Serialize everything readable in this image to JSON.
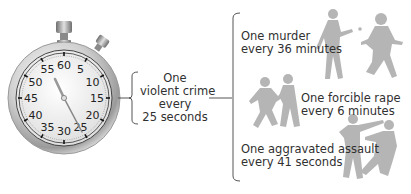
{
  "stopwatch": {
    "dial_numbers": [
      "60",
      "5",
      "10",
      "15",
      "20",
      "25",
      "30",
      "35",
      "40",
      "45",
      "50",
      "55"
    ],
    "hand_position_seconds": 25
  },
  "summary": {
    "line1": "One",
    "line2": "violent crime",
    "line3": "every",
    "line4": "25 seconds"
  },
  "crimes": [
    {
      "line1": "One murder",
      "line2": "every 36 minutes",
      "figure": "shooting-silhouette"
    },
    {
      "line1": "One forcible rape",
      "line2": "every 6 minutes",
      "figure": "struggle-silhouette"
    },
    {
      "line1": "One aggravated assault",
      "line2": "every 41 seconds",
      "figure": "fight-silhouette"
    }
  ],
  "colors": {
    "silhouette": "#b3b3b3",
    "bracket": "#555555",
    "text": "#303030",
    "dial_face": "#f2f2f2",
    "case": "#c8c8c8"
  }
}
